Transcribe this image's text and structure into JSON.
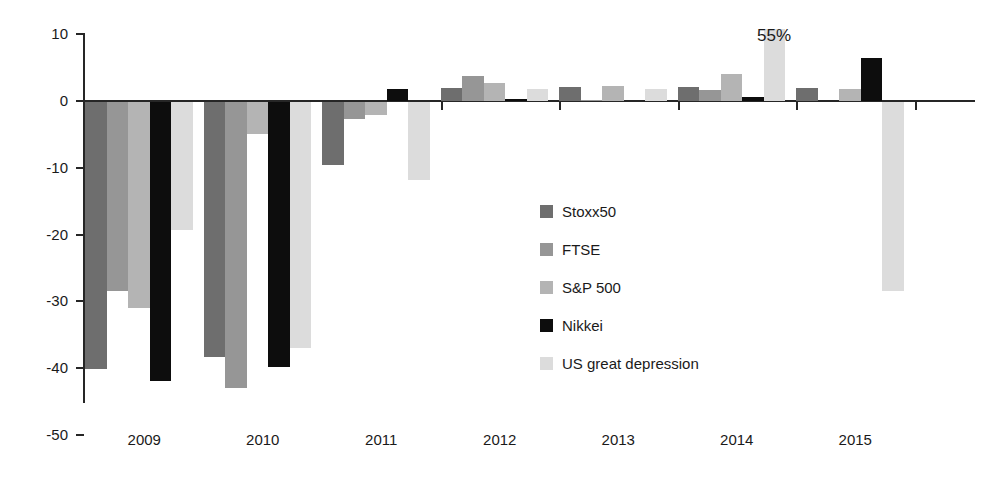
{
  "chart_data": {
    "type": "bar",
    "title": "",
    "subtitle": "",
    "xlabel": "",
    "ylabel": "",
    "categories": [
      "2009",
      "2010",
      "2011",
      "2012",
      "2013",
      "2014",
      "2015"
    ],
    "series": [
      {
        "name": "Stoxx50",
        "color": "#6e6e6e",
        "values": [
          -40.0,
          -38.2,
          -9.4,
          2.0,
          2.1,
          2.1,
          2.0
        ]
      },
      {
        "name": "FTSE",
        "color": "#969696",
        "values": [
          -28.3,
          -42.8,
          -2.5,
          3.8,
          0.2,
          1.7,
          0.0
        ]
      },
      {
        "name": "S&P 500",
        "color": "#b4b4b4",
        "values": [
          -30.9,
          -4.8,
          -2.0,
          2.7,
          2.2,
          4.0,
          1.8
        ]
      },
      {
        "name": "Nikkei",
        "color": "#0d0d0d",
        "values": [
          -41.8,
          -39.7,
          1.8,
          0.3,
          0.0,
          0.6,
          6.4
        ]
      },
      {
        "name": "US great depression",
        "color": "#dcdcdc",
        "values": [
          -19.2,
          -36.8,
          -11.7,
          1.8,
          1.8,
          10.8,
          -28.3
        ]
      }
    ],
    "ylim": [
      -50,
      10
    ],
    "yticks": [
      10,
      0,
      -10,
      -20,
      -30,
      -40,
      -50
    ],
    "ytick_labels": [
      "10",
      "0",
      "-10",
      "-20",
      "-30",
      "-40",
      "-50"
    ],
    "grid": false,
    "legend_position": "center",
    "annotations": [
      {
        "text": "55%",
        "series": "US great depression",
        "category": "2014",
        "x_px": 757,
        "y_px": 27
      }
    ]
  },
  "axis": {
    "y_labels": [
      "10",
      "0",
      "-10",
      "-20",
      "-30",
      "-40",
      "-50"
    ],
    "x_labels": [
      "2009",
      "2010",
      "2011",
      "2012",
      "2013",
      "2014",
      "2015"
    ]
  },
  "legend": {
    "items": [
      {
        "label": "Stoxx50",
        "color": "#6e6e6e"
      },
      {
        "label": "FTSE",
        "color": "#969696"
      },
      {
        "label": "S&P 500",
        "color": "#b4b4b4"
      },
      {
        "label": "Nikkei",
        "color": "#0d0d0d"
      },
      {
        "label": "US great depression",
        "color": "#dcdcdc"
      }
    ]
  },
  "annotation": {
    "label_55": "55%"
  },
  "colors": {
    "axis": "#262626",
    "text": "#1a1a1a",
    "background": "#ffffff"
  }
}
